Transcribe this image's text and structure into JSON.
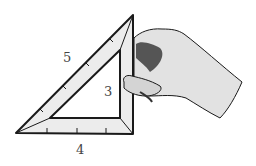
{
  "figure": {
    "labels": {
      "hypotenuse": "5",
      "vertical_side": "3",
      "base": "4"
    },
    "colors": {
      "outline": "#1a1a1a",
      "fill": "#ececec",
      "hand": "#e2e2e2",
      "shadow": "#555555",
      "label": "#444444"
    }
  }
}
